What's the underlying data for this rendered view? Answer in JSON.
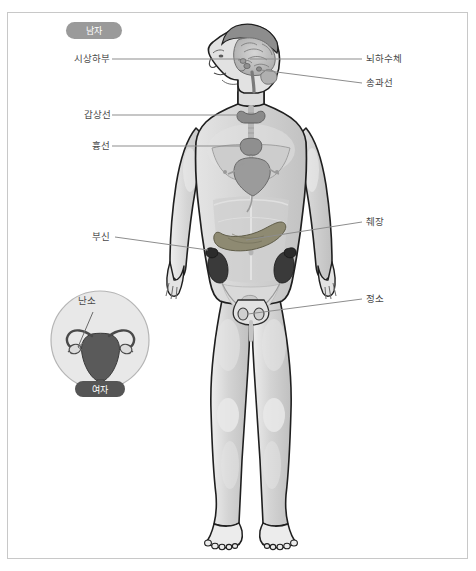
{
  "figure": {
    "title_badge_male": "남자",
    "title_badge_female": "여자",
    "frame_color": "#c8c8c8",
    "background": "#ffffff",
    "label_color": "#4a4a4a",
    "leader_color": "#8d8d8d"
  },
  "labels_left": [
    {
      "text": "시상하부",
      "x": 74,
      "y": 56
    },
    {
      "text": "갑상선",
      "x": 84,
      "y": 112
    },
    {
      "text": "흉선",
      "x": 92,
      "y": 143
    },
    {
      "text": "부신",
      "x": 92,
      "y": 234
    }
  ],
  "labels_right": [
    {
      "text": "뇌하수체",
      "x": 366,
      "y": 56
    },
    {
      "text": "송과선",
      "x": 366,
      "y": 80
    },
    {
      "text": "췌장",
      "x": 366,
      "y": 219
    },
    {
      "text": "정소",
      "x": 366,
      "y": 296
    }
  ],
  "inset": {
    "label": "난소",
    "badge": "여자",
    "circle_fill": "#e8e8e8",
    "circle_stroke": "#b5b5b5"
  },
  "organs": [
    {
      "name": "hypothalamus",
      "color": "#9c9c9c"
    },
    {
      "name": "pituitary",
      "color": "#9c9c9c"
    },
    {
      "name": "pineal",
      "color": "#9c9c9c"
    },
    {
      "name": "thyroid",
      "color": "#8a8a8a"
    },
    {
      "name": "thymus",
      "color": "#8f8f8f"
    },
    {
      "name": "heart",
      "color": "#9b9b9b"
    },
    {
      "name": "pancreas",
      "color": "#8e8a72"
    },
    {
      "name": "adrenal",
      "color": "#2b2b2b"
    },
    {
      "name": "kidney",
      "color": "#3a3a3a"
    },
    {
      "name": "testis",
      "color": "#cfcfcf"
    },
    {
      "name": "ovary",
      "color": "#dcdcdc"
    },
    {
      "name": "uterus",
      "color": "#5a5a5a"
    }
  ],
  "body": {
    "skin_fill": "#d8d8d8",
    "skin_stroke": "#1f1f1f",
    "muscle_fill": "#c4c4c4",
    "highlight": "#e6e6e6"
  }
}
